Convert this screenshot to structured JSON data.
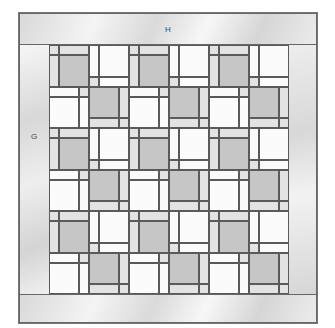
{
  "diagram": {
    "type": "quilt-layout",
    "labels": {
      "top_border": "H",
      "side_border": "G"
    },
    "grid": {
      "rows": 6,
      "columns": 6,
      "row_pattern_odd": [
        "A",
        "B",
        "A",
        "B",
        "A",
        "B"
      ],
      "row_pattern_even": [
        "C",
        "D",
        "C",
        "D",
        "C",
        "D"
      ]
    },
    "block_types": {
      "A": "gray square with light corner, top strip and left strip",
      "B": "white square with left strip, bottom strip and light bottom-left corner",
      "C": "white square with top strip, right strip and light top-right corner",
      "D": "gray square with light right strip, bottom strip and bottom-right corner"
    },
    "colors": {
      "dark_square": "#c6c6c6",
      "light_strip": "#e3e3e3",
      "white": "#fbfbfb",
      "seam": "#5a5a5a"
    }
  }
}
